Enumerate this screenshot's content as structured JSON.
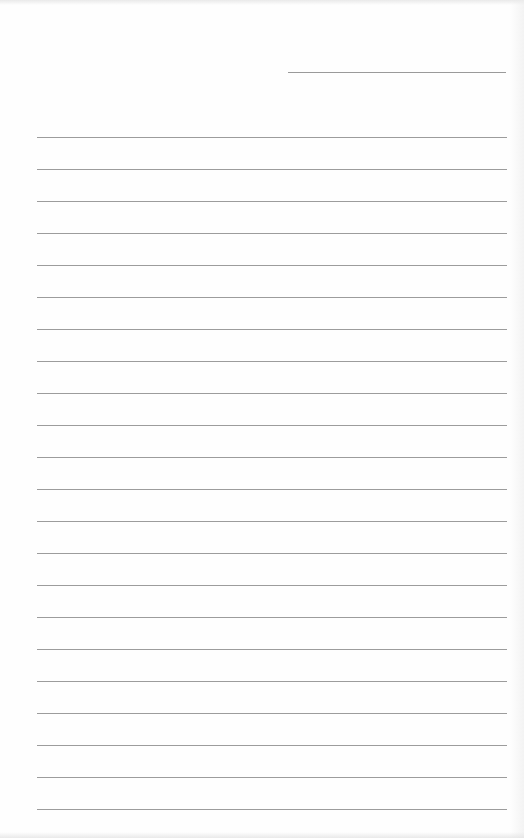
{
  "document": {
    "type": "lined-paper",
    "header_line": {
      "label": "",
      "value": ""
    },
    "line_count": 22,
    "line_spacing_px": 32,
    "first_line_y_px": 137,
    "lines": [
      "",
      "",
      "",
      "",
      "",
      "",
      "",
      "",
      "",
      "",
      "",
      "",
      "",
      "",
      "",
      "",
      "",
      "",
      "",
      "",
      "",
      ""
    ],
    "colors": {
      "paper": "#fefefe",
      "rule": "#9c9c9c"
    }
  }
}
